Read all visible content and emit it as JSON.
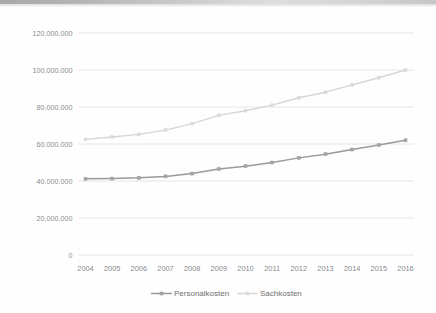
{
  "chart_data": {
    "type": "line",
    "title": "",
    "xlabel": "",
    "ylabel": "",
    "categories": [
      "2004",
      "2005",
      "2006",
      "2007",
      "2008",
      "2009",
      "2010",
      "2011",
      "2012",
      "2013",
      "2014",
      "2015",
      "2016"
    ],
    "ylim": [
      0,
      120000000
    ],
    "ytick_values": [
      0,
      20000000,
      40000000,
      60000000,
      80000000,
      100000000,
      120000000
    ],
    "ytick_labels": [
      "0",
      "20.000.000",
      "40.000.000",
      "60.000.000",
      "80.000.000",
      "100.000.000",
      "120.000.000"
    ],
    "grid": true,
    "legend_position": "bottom",
    "series": [
      {
        "name": "Personalkosten",
        "color": "#9a9a9a",
        "marker": "square",
        "values": [
          41200000,
          41300000,
          41700000,
          42500000,
          44000000,
          46500000,
          48000000,
          50000000,
          52500000,
          54500000,
          57000000,
          59500000,
          62000000
        ]
      },
      {
        "name": "Sachkosten",
        "color": "#d6d6d6",
        "marker": "square",
        "values": [
          62500000,
          63800000,
          65200000,
          67500000,
          71000000,
          75500000,
          78000000,
          81000000,
          85000000,
          88000000,
          92000000,
          95800000,
          100000000
        ]
      }
    ]
  },
  "legend": {
    "items": [
      {
        "label": "Personalkosten",
        "color": "#9a9a9a"
      },
      {
        "label": "Sachkosten",
        "color": "#d6d6d6"
      }
    ]
  },
  "colors": {
    "grid": "#e3e3e3",
    "axis_text": "#8a8a8a",
    "background": "#fefefe",
    "series_personalkosten": "#9a9a9a",
    "series_sachkosten": "#d6d6d6"
  }
}
